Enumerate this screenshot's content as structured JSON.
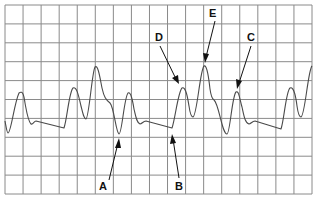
{
  "figure": {
    "type": "waveform-trace",
    "grid": {
      "columns": 17,
      "rows": 10,
      "color": "#8a8a8a",
      "background": "#ffffff"
    },
    "trace_color": "#4a4a4a",
    "label_color": "#111111",
    "labels": [
      {
        "id": "A",
        "text": "A",
        "target": "trough after first small peak"
      },
      {
        "id": "B",
        "text": "B",
        "target": "baseline end before rise"
      },
      {
        "id": "C",
        "text": "C",
        "target": "secondary peak after trough"
      },
      {
        "id": "D",
        "text": "D",
        "target": "first peak of complex"
      },
      {
        "id": "E",
        "text": "E",
        "target": "tallest peak"
      }
    ]
  }
}
